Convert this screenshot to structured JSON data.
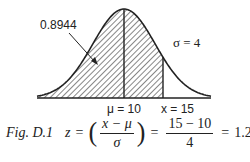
{
  "figure": {
    "id_label": "Fig. D.1",
    "annotation_area": "0.8944",
    "sigma_label": "σ = 4",
    "mu_label": "μ = 10",
    "x_label": "x = 15",
    "equation": {
      "lhs": "z",
      "eq1": "=",
      "open_paren": "(",
      "frac1_num": "x − μ",
      "frac1_den": "σ",
      "close_paren": ")",
      "eq2": "=",
      "frac2_num": "15 − 10",
      "frac2_den": "4",
      "eq3": "=",
      "result": "1.25."
    }
  },
  "chart_data": {
    "type": "area",
    "distribution": "normal",
    "mean": 10,
    "std_dev": 4,
    "shaded_region": {
      "from": "-inf",
      "to": 15,
      "area": 0.8944
    },
    "vertical_markers": [
      {
        "x": 10,
        "label": "μ = 10"
      },
      {
        "x": 15,
        "label": "x = 15"
      }
    ],
    "annotations": [
      "0.8944",
      "σ = 4"
    ],
    "z_score": 1.25,
    "grid": false
  },
  "colors": {
    "ink": "#222222",
    "background": "#ffffff"
  }
}
